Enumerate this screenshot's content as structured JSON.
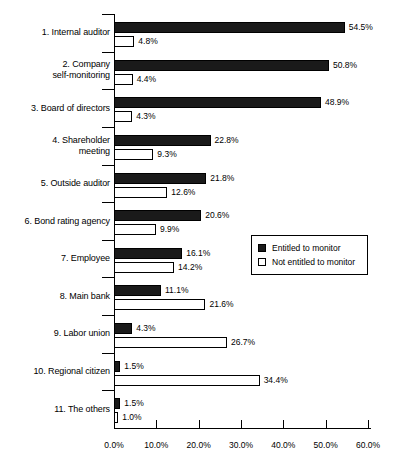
{
  "chart_data": {
    "type": "bar",
    "orientation": "horizontal",
    "title": "",
    "xlabel": "",
    "ylabel": "",
    "xlim": [
      0,
      60
    ],
    "grid": false,
    "legend_position": "middle-right",
    "xticks": [
      "0.0%",
      "10.0%",
      "20.0%",
      "30.0%",
      "40.0%",
      "50.0%",
      "60.0%"
    ],
    "xtick_values": [
      0,
      10,
      20,
      30,
      40,
      50,
      60
    ],
    "categories": [
      "1. Internal auditor",
      "2. Company\nself-monitoring",
      "3. Board of directors",
      "4. Shareholder\nmeeting",
      "5. Outside auditor",
      "6. Bond rating agency",
      "7. Employee",
      "8. Main bank",
      "9. Labor union",
      "10. Regional citizen",
      "11. The others"
    ],
    "series": [
      {
        "name": "Entitled to monitor",
        "color": "#1a1a1a",
        "values": [
          54.5,
          50.8,
          48.9,
          22.8,
          21.8,
          20.6,
          16.1,
          11.1,
          4.3,
          1.5,
          1.5
        ],
        "labels": [
          "54.5%",
          "50.8%",
          "48.9%",
          "22.8%",
          "21.8%",
          "20.6%",
          "16.1%",
          "11.1%",
          "4.3%",
          "1.5%",
          "1.5%"
        ]
      },
      {
        "name": "Not entitled to monitor",
        "color": "#ffffff",
        "values": [
          4.8,
          4.4,
          4.3,
          9.3,
          12.6,
          9.9,
          14.2,
          21.6,
          26.7,
          34.4,
          1.0
        ],
        "labels": [
          "4.8%",
          "4.4%",
          "4.3%",
          "9.3%",
          "12.6%",
          "9.9%",
          "14.2%",
          "21.6%",
          "26.7%",
          "34.4%",
          "1.0%"
        ]
      }
    ]
  },
  "legend": {
    "entries": [
      {
        "label": "Entitled to monitor",
        "swatch": "filled-black-square"
      },
      {
        "label": "Not entitled to monitor",
        "swatch": "open-white-square"
      }
    ]
  }
}
